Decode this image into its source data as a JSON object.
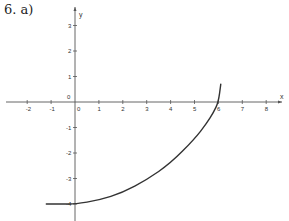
{
  "problem_label": "6. a)",
  "chart_data": {
    "type": "line",
    "title": "",
    "xlabel": "x",
    "ylabel": "y",
    "xlim": [
      -2.5,
      8.8
    ],
    "ylim": [
      -4.6,
      3.7
    ],
    "grid": false,
    "x_ticks": [
      -2,
      -1,
      0,
      1,
      2,
      3,
      4,
      5,
      6,
      7,
      8
    ],
    "y_ticks": [
      3,
      2,
      1,
      0,
      -1,
      -2,
      -3,
      -4
    ],
    "x_tick_labels": [
      "-2",
      "-1",
      "0",
      "1",
      "2",
      "3",
      "4",
      "5",
      "6",
      "7",
      "8"
    ],
    "y_tick_labels": [
      "3",
      "2",
      "1",
      "0",
      "-1",
      "-2",
      "-3",
      "-4"
    ],
    "series": [
      {
        "name": "curve",
        "color": "#333333",
        "x": [
          -1.2,
          -0.5,
          0,
          1,
          2,
          3,
          4,
          5,
          5.5,
          5.8,
          6.0,
          6.1
        ],
        "y": [
          -4.0,
          -4.0,
          -4.0,
          -3.85,
          -3.55,
          -3.05,
          -2.4,
          -1.45,
          -0.85,
          -0.4,
          0.0,
          0.7
        ]
      }
    ],
    "colors": {
      "axis": "#555555",
      "curve": "#333333",
      "text": "#333333"
    }
  }
}
